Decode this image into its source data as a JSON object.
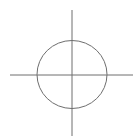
{
  "diagram": {
    "type": "crosshair-circle",
    "background": "#ffffff",
    "stroke_color": "#6e6e6e",
    "stroke_width": 1,
    "circle": {
      "cx": 72,
      "cy": 74.5,
      "rx": 35,
      "ry": 34
    },
    "horizontal_axis": {
      "x1": 10,
      "y1": 75,
      "x2": 133,
      "y2": 75
    },
    "vertical_axis": {
      "x1": 72,
      "y1": 10,
      "x2": 72,
      "y2": 136
    }
  }
}
